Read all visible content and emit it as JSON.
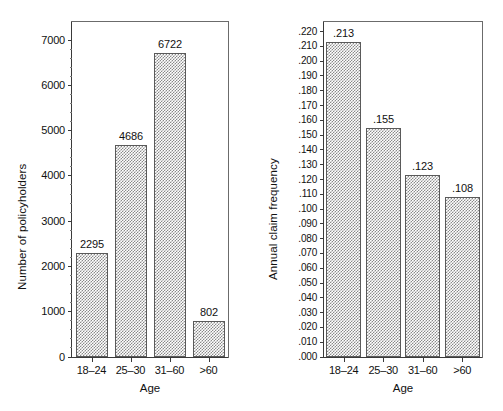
{
  "chart_data": [
    {
      "id": "policyholders",
      "type": "bar",
      "title": "",
      "xlabel": "Age",
      "ylabel": "Number of policyholders",
      "categories": [
        "18–24",
        "25–30",
        "31–60",
        ">60"
      ],
      "values": [
        2295,
        4686,
        6722,
        802
      ],
      "value_labels": [
        "2295",
        "4686",
        "6722",
        "802"
      ],
      "ylim": [
        0,
        7400
      ],
      "ytick_values": [
        0,
        1000,
        2000,
        3000,
        4000,
        5000,
        6000,
        7000
      ],
      "ytick_labels": [
        "0",
        "1000",
        "2000",
        "3000",
        "4000",
        "5000",
        "6000",
        "7000"
      ],
      "minor_tick_step": 200,
      "grid": false,
      "legend": "none"
    },
    {
      "id": "claim-frequency",
      "type": "bar",
      "title": "",
      "xlabel": "Age",
      "ylabel": "Annual claim frequency",
      "categories": [
        "18–24",
        "25–30",
        "31–60",
        ">60"
      ],
      "values": [
        0.213,
        0.155,
        0.123,
        0.108
      ],
      "value_labels": [
        ".213",
        ".155",
        ".123",
        ".108"
      ],
      "ylim": [
        0,
        0.2265
      ],
      "ytick_values": [
        0.0,
        0.01,
        0.02,
        0.03,
        0.04,
        0.05,
        0.06,
        0.07,
        0.08,
        0.09,
        0.1,
        0.11,
        0.12,
        0.13,
        0.14,
        0.15,
        0.16,
        0.17,
        0.18,
        0.19,
        0.2,
        0.21,
        0.22
      ],
      "ytick_labels": [
        ".000",
        ".010",
        ".020",
        ".030",
        ".040",
        ".050",
        ".060",
        ".070",
        ".080",
        ".090",
        ".100",
        ".110",
        ".120",
        ".130",
        ".140",
        ".150",
        ".160",
        ".170",
        ".180",
        ".190",
        ".200",
        ".210",
        ".220"
      ],
      "grid": false,
      "legend": "none"
    }
  ],
  "style": {
    "bar_fill": "#8a8a8a",
    "bar_edge": "#5a5a5a",
    "axis_color": "#3a3a3a",
    "frame_color": "#6b6b6b",
    "text_color": "#111111",
    "background": "#ffffff"
  }
}
